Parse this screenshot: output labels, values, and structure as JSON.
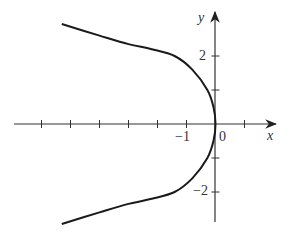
{
  "chart_data": {
    "type": "line",
    "title": "",
    "xlabel": "x",
    "ylabel": "y",
    "origin_label": "0",
    "x_tick_labels": [
      {
        "value": -1,
        "label": "−1"
      }
    ],
    "y_tick_labels": [
      {
        "value": 2,
        "label": "2"
      },
      {
        "value": -2,
        "label": "−2"
      }
    ],
    "x_ticks": [
      -6,
      -5,
      -4,
      -3,
      -2,
      -1,
      1
    ],
    "y_ticks": [
      -2,
      -1,
      1,
      2
    ],
    "xlim": [
      -6.0,
      2.0
    ],
    "ylim": [
      -3.0,
      3.3
    ],
    "grid": false,
    "legend": null,
    "series": [
      {
        "name": "curve",
        "x": [
          -5.3,
          -4.0,
          -3.0,
          -2.2,
          -1.41,
          -0.8,
          -0.28,
          -0.07,
          0,
          -0.07,
          -0.28,
          -0.8,
          -1.41,
          -2.2,
          -3.0,
          -4.0,
          -5.3
        ],
        "y": [
          2.94,
          2.6,
          2.35,
          2.2,
          2.0,
          1.6,
          1.0,
          0.5,
          0,
          -0.5,
          -1.0,
          -1.6,
          -2.0,
          -2.2,
          -2.35,
          -2.6,
          -2.94
        ]
      }
    ]
  },
  "colors": {
    "axis": "#333333",
    "curve": "#1a1a1a",
    "background": "#ffffff"
  }
}
